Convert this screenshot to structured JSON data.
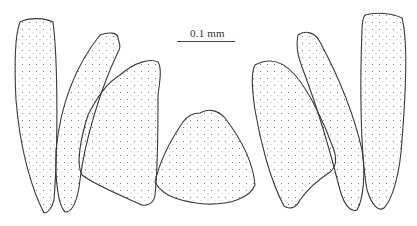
{
  "figure": {
    "scale_bar": {
      "label": "0.1 mm"
    },
    "elements": [
      {
        "name": "left-outer-plate"
      },
      {
        "name": "left-middle-plate"
      },
      {
        "name": "left-inner-plate"
      },
      {
        "name": "center-dome-plate"
      },
      {
        "name": "right-inner-plate"
      },
      {
        "name": "right-middle-plate"
      },
      {
        "name": "right-outer-plate"
      }
    ],
    "colors": {
      "outline": "#3a3a3a",
      "stipple": "#555555",
      "background": "#ffffff"
    }
  }
}
